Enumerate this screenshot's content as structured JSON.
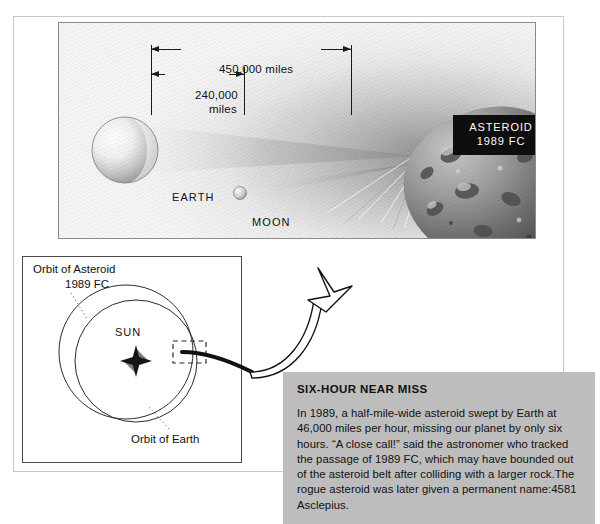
{
  "page": {
    "illustration": {
      "dimensions": [
        {
          "id": "450",
          "text": "450,000 miles"
        },
        {
          "id": "240a",
          "text": "240,000"
        },
        {
          "id": "240b",
          "text": "miles"
        }
      ],
      "bodies": [
        {
          "id": "earth",
          "label": "EARTH"
        },
        {
          "id": "moon",
          "label": "MOON"
        }
      ],
      "nameplate": {
        "line1": "ASTEROID",
        "line2": "1989 FC",
        "background": "#0e0e0e",
        "color": "#ffffff"
      }
    },
    "orbit_diagram": {
      "asteroid_orbit_label_line1": "Orbit of Asteroid",
      "asteroid_orbit_label_line2": "1989 FC",
      "sun_label": "SUN",
      "earth_orbit_label": "Orbit of Earth"
    },
    "caption": {
      "title": "SIX-HOUR NEAR MISS",
      "body": "In 1989, a half-mile-wide asteroid swept by Earth at 46,000 miles per hour, missing our planet by only six hours. “A close call!” said the astronomer who tracked the passage of 1989 FC, which may have bounded out of the asteroid belt after colliding with a larger rock.The rogue asteroid was later given a permanent name:4581 Asclepius.",
      "background": "#bdbdbd"
    }
  }
}
